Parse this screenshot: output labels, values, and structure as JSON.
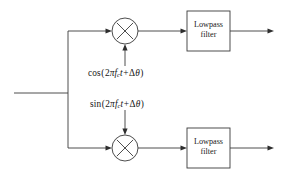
{
  "diagram": {
    "background_color": "#ffffff",
    "line_color": "#3a3a3a",
    "text_color": "#141414",
    "width": 282,
    "height": 176,
    "input": {
      "name": "input-signal-line",
      "label": ""
    },
    "branches": [
      {
        "id": "inphase",
        "mixer": {
          "name": "mixer-top",
          "symbol": "circle-with-x",
          "cx": 125,
          "cy": 31,
          "r": 13
        },
        "oscillator": {
          "name": "cos-oscillator-label",
          "function": "cos",
          "open_paren": "(",
          "coefficient": "2",
          "pi": "π",
          "carrier": "f",
          "carrier_subscript": "c",
          "time": "t",
          "operator": "+",
          "delta": "Δ",
          "theta": "θ",
          "close_paren": ")",
          "full_text": "cos (2πf_c t + Δθ)",
          "arrow_direction": "up"
        },
        "filter": {
          "name": "lowpass-filter-top",
          "line1": "Lowpass",
          "line2": "filter"
        },
        "output": {
          "name": "output-arrow-top",
          "label": ""
        }
      },
      {
        "id": "quadrature",
        "mixer": {
          "name": "mixer-bottom",
          "symbol": "circle-with-x",
          "cx": 125,
          "cy": 148,
          "r": 13
        },
        "oscillator": {
          "name": "sin-oscillator-label",
          "function": "sin",
          "open_paren": "(",
          "coefficient": "2",
          "pi": "π",
          "carrier": "f",
          "carrier_subscript": "c",
          "time": "t",
          "operator": "+",
          "delta": "Δ",
          "theta": "θ",
          "close_paren": ")",
          "full_text": "sin (2πf_c t + Δθ)",
          "arrow_direction": "down"
        },
        "filter": {
          "name": "lowpass-filter-bottom",
          "line1": "Lowpass",
          "line2": "filter"
        },
        "output": {
          "name": "output-arrow-bottom",
          "label": ""
        }
      }
    ]
  }
}
